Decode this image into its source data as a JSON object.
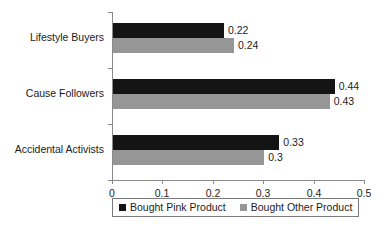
{
  "chart_data": {
    "type": "bar",
    "orientation": "horizontal",
    "title": "",
    "subtitle": "",
    "xlabel": "",
    "ylabel": "",
    "categories": [
      "Lifestyle Buyers",
      "Cause Followers",
      "Accidental Activists"
    ],
    "series": [
      {
        "name": "Bought Pink Product",
        "color": "#141414",
        "values": [
          0.22,
          0.44,
          0.33
        ],
        "labels": [
          "0.22",
          "0.44",
          "0.33"
        ]
      },
      {
        "name": "Bought Other Product",
        "color": "#969696",
        "values": [
          0.24,
          0.43,
          0.3
        ],
        "labels": [
          "0.24",
          "0.43",
          "0.3"
        ]
      }
    ],
    "xlim": [
      0,
      0.5
    ],
    "xticks": [
      0,
      0.1,
      0.2,
      0.3,
      0.4,
      0.5
    ],
    "xtick_labels": [
      "0",
      "0.1",
      "0.2",
      "0.3",
      "0.4",
      "0.5"
    ],
    "grid": false,
    "legend_position": "bottom",
    "data_labels": true,
    "background": "#ffffff"
  },
  "legend": {
    "items": [
      {
        "label": "Bought Pink Product",
        "color": "#141414",
        "swatch": "square-swatch-black"
      },
      {
        "label": "Bought Other Product",
        "color": "#969696",
        "swatch": "square-swatch-gray"
      }
    ]
  }
}
